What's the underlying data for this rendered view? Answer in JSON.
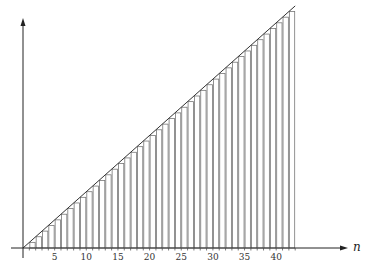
{
  "chart_data": {
    "type": "bar",
    "title": "",
    "xlabel": "n",
    "ylabel": "",
    "x_ticks": [
      5,
      10,
      15,
      20,
      25,
      30,
      35,
      40
    ],
    "xlim": [
      0,
      43
    ],
    "ylim": [
      0,
      43
    ],
    "bars": {
      "x_start": [
        0,
        1,
        2,
        3,
        4,
        5,
        6,
        7,
        8,
        9,
        10,
        11,
        12,
        13,
        14,
        15,
        16,
        17,
        18,
        19,
        20,
        21,
        22,
        23,
        24,
        25,
        26,
        27,
        28,
        29,
        30,
        31,
        32,
        33,
        34,
        35,
        36,
        37,
        38,
        39,
        40,
        41,
        42
      ],
      "heights": [
        0,
        1,
        2,
        3,
        4,
        5,
        6,
        7,
        8,
        9,
        10,
        11,
        12,
        13,
        14,
        15,
        16,
        17,
        18,
        19,
        20,
        21,
        22,
        23,
        24,
        25,
        26,
        27,
        28,
        29,
        30,
        31,
        32,
        33,
        34,
        35,
        36,
        37,
        38,
        39,
        40,
        41,
        42
      ],
      "width": 1
    },
    "line": {
      "name": "y = n",
      "x": [
        0,
        43
      ],
      "y": [
        0,
        43
      ]
    },
    "grid": false,
    "legend": null
  },
  "layout": {
    "origin_px": [
      23,
      248
    ],
    "px_per_unit_x": 6.33,
    "px_per_unit_y": 5.63,
    "x_axis_end_px": 348,
    "y_axis_top_px": 18,
    "color_bars": "#777777",
    "color_line": "#333333",
    "color_axes": "#222222"
  }
}
